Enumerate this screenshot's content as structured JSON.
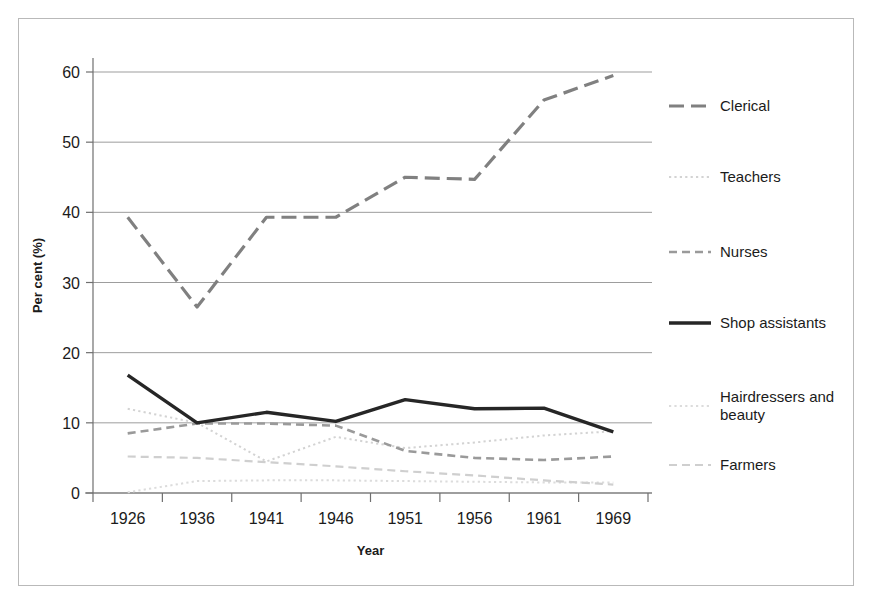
{
  "chart_data": {
    "type": "line",
    "title": "",
    "xlabel": "Year",
    "ylabel": "Per cent (%)",
    "categories": [
      "1926",
      "1936",
      "1941",
      "1946",
      "1951",
      "1956",
      "1961",
      "1969"
    ],
    "ylim": [
      0,
      63
    ],
    "yticks": [
      0,
      10,
      20,
      30,
      40,
      50,
      60
    ],
    "ytick_labels": [
      "0",
      "10",
      "20",
      "30",
      "40",
      "50",
      "60"
    ],
    "grid": true,
    "grid_axis": "y",
    "legend_position": "right",
    "series": [
      {
        "name": "Clerical",
        "color": "#808080",
        "style": "long-dash",
        "width": 3.2,
        "values": [
          39.3,
          26.5,
          39.3,
          39.3,
          45.0,
          44.7,
          56.0,
          59.5
        ]
      },
      {
        "name": "Teachers",
        "color": "#d3d3d3",
        "style": "dotted",
        "width": 2.0,
        "values": [
          12.0,
          10.0,
          4.5,
          8.0,
          6.4,
          7.2,
          8.2,
          8.8
        ]
      },
      {
        "name": "Nurses",
        "color": "#9a9a9a",
        "style": "dash",
        "width": 2.6,
        "values": [
          8.5,
          9.9,
          9.9,
          9.6,
          6.0,
          5.0,
          4.7,
          5.2
        ]
      },
      {
        "name": "Shop assistants",
        "color": "#262626",
        "style": "solid",
        "width": 3.4,
        "values": [
          16.8,
          10.0,
          11.5,
          10.2,
          13.3,
          12.0,
          12.1,
          8.7
        ]
      },
      {
        "name": "Hairdressers and\nbeauty",
        "color": "#dcdcdc",
        "style": "dotted",
        "width": 2.0,
        "values": [
          0.1,
          1.7,
          1.8,
          1.8,
          1.7,
          1.6,
          1.5,
          1.5
        ]
      },
      {
        "name": "Farmers",
        "color": "#cfcfcf",
        "style": "dash",
        "width": 2.2,
        "values": [
          5.2,
          5.0,
          4.4,
          3.8,
          3.1,
          2.5,
          1.8,
          1.2
        ]
      }
    ]
  },
  "legend": {
    "items": [
      {
        "label": "Clerical"
      },
      {
        "label": "Teachers"
      },
      {
        "label": "Nurses"
      },
      {
        "label": "Shop assistants"
      },
      {
        "label": "Hairdressers and\nbeauty"
      },
      {
        "label": "Farmers"
      }
    ]
  }
}
